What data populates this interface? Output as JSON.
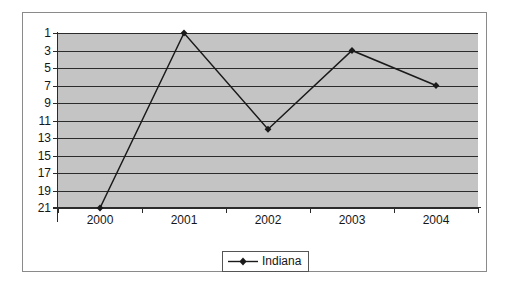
{
  "chart_data": {
    "type": "line",
    "title": "",
    "xlabel": "",
    "ylabel": "",
    "categories": [
      "2000",
      "2001",
      "2002",
      "2003",
      "2004"
    ],
    "series": [
      {
        "name": "Indiana",
        "values": [
          21,
          1,
          12,
          3,
          7
        ],
        "marker": "diamond",
        "color": "#1a1a1a"
      }
    ],
    "y_ticks": [
      1,
      3,
      5,
      7,
      9,
      11,
      13,
      15,
      17,
      19,
      21
    ],
    "ylim": [
      1,
      21
    ],
    "y_inverted": true,
    "grid": true,
    "legend_position": "bottom",
    "plot_background": "#c4c4c4",
    "gridline_color": "#2b2b2b",
    "border_color": "#8a8a8a"
  },
  "legend": {
    "entries": [
      {
        "label": "Indiana"
      }
    ]
  }
}
